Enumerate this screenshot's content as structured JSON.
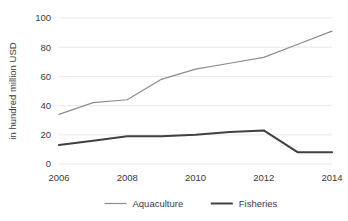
{
  "chart_data": {
    "type": "line",
    "title": "",
    "subtitle": "",
    "xlabel": "",
    "ylabel": "in hundred million USD",
    "x": [
      2006,
      2007,
      2008,
      2009,
      2010,
      2011,
      2012,
      2013,
      2014
    ],
    "xtick_labels": [
      "2006",
      "2008",
      "2010",
      "2012",
      "2014"
    ],
    "xticks": [
      2006,
      2008,
      2010,
      2012,
      2014
    ],
    "ytick_labels": [
      "0",
      "20",
      "40",
      "60",
      "80",
      "100"
    ],
    "yticks": [
      0,
      20,
      40,
      60,
      80,
      100
    ],
    "xlim": [
      2006,
      2014
    ],
    "ylim": [
      0,
      100
    ],
    "grid": "horizontal",
    "legend_position": "bottom-center",
    "series": [
      {
        "name": "Aquaculture",
        "color": "#8c8c8c",
        "line_width": 1.2,
        "values": [
          34,
          42,
          44,
          58,
          65,
          69,
          73,
          82,
          91
        ]
      },
      {
        "name": "Fisheries",
        "color": "#404040",
        "line_width": 2.0,
        "values": [
          13,
          16,
          19,
          19,
          20,
          22,
          23,
          8,
          8
        ]
      }
    ]
  },
  "legend": {
    "items": [
      {
        "label": "Aquaculture",
        "color": "#8c8c8c",
        "line_width": 1.2
      },
      {
        "label": "Fisheries",
        "color": "#404040",
        "line_width": 2.0
      }
    ]
  },
  "axes": {
    "y_axis_title": "in hundred million USD"
  },
  "colors": {
    "background": "#ffffff",
    "gridline": "#e2e2e2",
    "text": "#3a3a3a",
    "aquaculture": "#8c8c8c",
    "fisheries": "#404040"
  }
}
